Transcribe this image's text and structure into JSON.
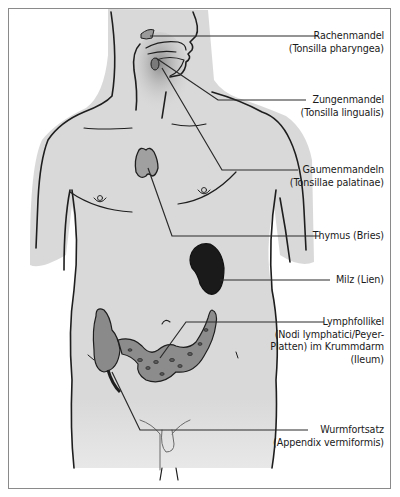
{
  "figure": {
    "colors": {
      "skin": "#d9d9d9",
      "outline": "#1e1e1e",
      "organ_mid": "#9a9a9a",
      "organ_dark": "#1a1a1a",
      "frame": "#8a8a8a"
    }
  },
  "labels": [
    {
      "id": "rachenmandel",
      "line1": "Rachenmandel",
      "line2": "(Tonsilla pharyngea)"
    },
    {
      "id": "zungenmandel",
      "line1": "Zungenmandel",
      "line2": "(Tonsilla lingualis)"
    },
    {
      "id": "gaumenmandeln",
      "line1": "Gaumenmandeln",
      "line2": "(Tonsillae palatinae)"
    },
    {
      "id": "thymus",
      "line1": "Thymus (Bries)"
    },
    {
      "id": "milz",
      "line1": "Milz (Lien)"
    },
    {
      "id": "lymphfollikel",
      "line1": "Lymphfollikel",
      "line2": "(Nodi lymphatici/Peyer-",
      "line3": "Platten) im Krummdarm",
      "line4": "(Ileum)"
    },
    {
      "id": "wurmfortsatz",
      "line1": "Wurmfortsatz",
      "line2": "(Appendix vermiformis)"
    }
  ]
}
